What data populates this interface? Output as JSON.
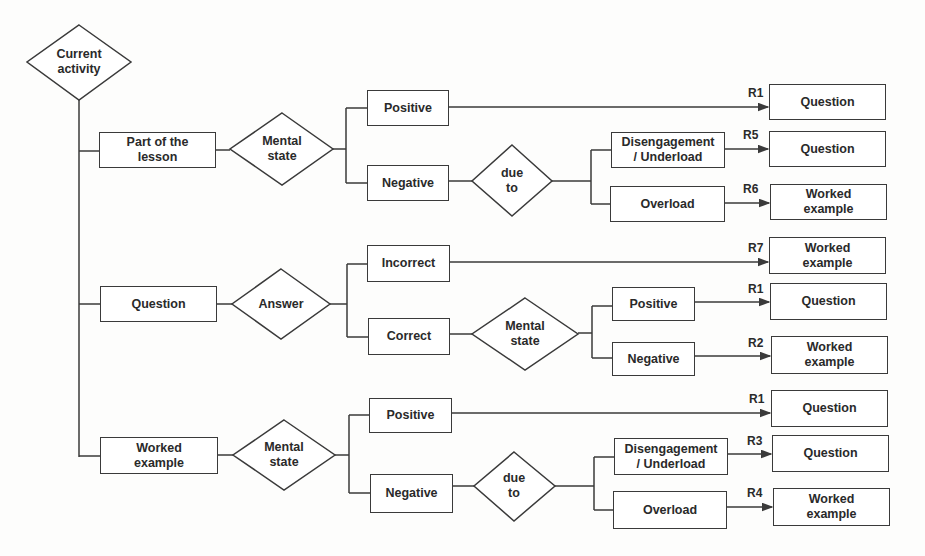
{
  "diagram": {
    "root": {
      "label": "Current activity"
    },
    "branches": [
      {
        "activity": "Part of the\nlesson",
        "decision": "Mental\nstate",
        "positive": {
          "label": "Positive",
          "rule": "R1",
          "result": "Question"
        },
        "negative": {
          "label": "Negative",
          "decision": "due\nto",
          "disengagement": {
            "label": "Disengagement\n/ Underload",
            "rule": "R5",
            "result": "Question"
          },
          "overload": {
            "label": "Overload",
            "rule": "R6",
            "result": "Worked\nexample"
          }
        }
      },
      {
        "activity": "Question",
        "decision": "Answer",
        "incorrect": {
          "label": "Incorrect",
          "rule": "R7",
          "result": "Worked\nexample"
        },
        "correct": {
          "label": "Correct",
          "decision": "Mental\nstate",
          "positive": {
            "label": "Positive",
            "rule": "R1",
            "result": "Question"
          },
          "negative": {
            "label": "Negative",
            "rule": "R2",
            "result": "Worked\nexample"
          }
        }
      },
      {
        "activity": "Worked\nexample",
        "decision": "Mental\nstate",
        "positive": {
          "label": "Positive",
          "rule": "R1",
          "result": "Question"
        },
        "negative": {
          "label": "Negative",
          "decision": "due\nto",
          "disengagement": {
            "label": "Disengagement\n/ Underload",
            "rule": "R3",
            "result": "Question"
          },
          "overload": {
            "label": "Overload",
            "rule": "R4",
            "result": "Worked\nexample"
          }
        }
      }
    ]
  },
  "colors": {
    "line": "#3a3a3a",
    "background": "#fdfdfc",
    "text": "#2a2a2a"
  }
}
